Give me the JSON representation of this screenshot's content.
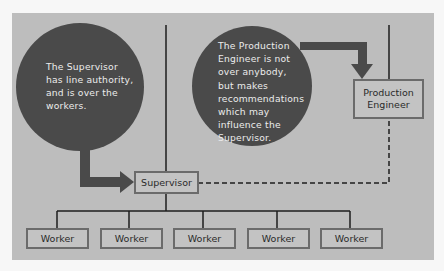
{
  "diagram": {
    "type": "organization-chart",
    "colors": {
      "page_background": "#f7f7f7",
      "panel_background": "#bdbdbd",
      "bubble_fill": "#4a4a4a",
      "bubble_text": "#ececec",
      "box_border": "#6b6b6b",
      "line": "#1e1e1e"
    },
    "bubbles": [
      {
        "id": "supervisor-note",
        "text": "The Supervisor has line authority, and is over the workers.",
        "lines": [
          "The Supervisor",
          "has line authority,",
          "and is over the",
          "workers."
        ],
        "points_to": "Supervisor"
      },
      {
        "id": "production-engineer-note",
        "text": "The Production Engineer is not over anybody, but makes recommendations which may influence the Supervisor.",
        "lines": [
          "The Production",
          "Engineer is not",
          "over anybody,",
          "but makes",
          "recommendations",
          "which may",
          "influence the",
          "Supervisor."
        ],
        "points_to": "Production Engineer"
      }
    ],
    "nodes": {
      "supervisor": "Supervisor",
      "production_engineer": [
        "Production",
        "Engineer"
      ],
      "workers": [
        "Worker",
        "Worker",
        "Worker",
        "Worker",
        "Worker"
      ]
    },
    "edges": [
      {
        "from": "above",
        "to": "Supervisor",
        "style": "solid"
      },
      {
        "from": "Supervisor",
        "to": "Worker (x5)",
        "style": "solid"
      },
      {
        "from": "above",
        "to": "Production Engineer",
        "style": "solid"
      },
      {
        "from": "Production Engineer",
        "to": "Supervisor",
        "style": "dashed"
      }
    ]
  }
}
